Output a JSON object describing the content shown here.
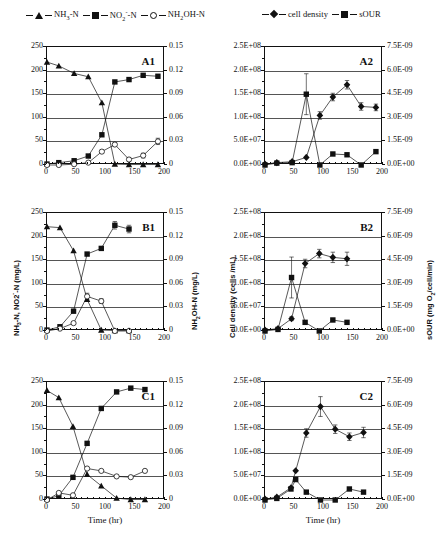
{
  "figure": {
    "legend_left": [
      {
        "label": "NH3-N",
        "marker": "triangle",
        "html": "NH<sub>3</sub>-N"
      },
      {
        "label": "NO2--N",
        "marker": "square",
        "html": "NO<sub>2</sub><sup>-</sup>-N"
      },
      {
        "label": "NH2OH-N",
        "marker": "open-circle",
        "html": "NH<sub>2</sub>OH-N"
      }
    ],
    "legend_right": [
      {
        "label": "cell density",
        "marker": "diamond",
        "html": "cell density"
      },
      {
        "label": "sOUR",
        "marker": "square",
        "html": "sOUR"
      }
    ],
    "axis_titles": {
      "left_primary": "NH3-N, NO2--N (mg/L)",
      "left_primary_html": "NH<sub>3</sub>-N, NO2<sup>-</sup>-N (mg/L)",
      "left_secondary": "NH2OH-N (mg/L)",
      "left_secondary_html": "NH<sub>2</sub>OH-N (mg/L)",
      "right_primary": "Cell density (cells /mL)",
      "right_secondary": "sOUR",
      "right_secondary_units": "(mg O2/cell/min)",
      "right_secondary_units_html": "(mg O<sub>2</sub>/cell/min)",
      "xlabel": "Time (hr)"
    },
    "ticks": {
      "x": [
        "0",
        "50",
        "100",
        "150",
        "200"
      ],
      "left_primary": [
        "0",
        "50",
        "100",
        "150",
        "200",
        "250"
      ],
      "left_secondary": [
        "0",
        "0.03",
        "0.06",
        "0.09",
        "0.12",
        "0.15"
      ],
      "right_primary": [
        "0.0E+00",
        "5.0E+07",
        "1.0E+08",
        "1.5E+08",
        "2.0E+08",
        "2.5E+08"
      ],
      "right_secondary": [
        "0.0E+00",
        "1.5E-09",
        "3.0E-09",
        "4.5E-09",
        "6.0E-09",
        "7.5E-09"
      ]
    },
    "panel_labels": [
      "A1",
      "A2",
      "B1",
      "B2",
      "C1",
      "C2"
    ]
  },
  "chart_data": [
    {
      "type": "line",
      "panel": "A1",
      "title": "A1",
      "xlabel": "Time (hr)",
      "ylabel": "NH3-N, NO2--N (mg/L)",
      "y2label": "NH2OH-N (mg/L)",
      "xlim": [
        0,
        200
      ],
      "ylim": [
        0,
        250
      ],
      "y2lim": [
        0,
        0.15
      ],
      "grid": true,
      "series": [
        {
          "name": "NH3-N",
          "axis": "left",
          "marker": "triangle",
          "x": [
            0,
            20,
            46,
            70,
            93,
            115,
            139,
            163,
            188
          ],
          "y": [
            218,
            210,
            194,
            187,
            132,
            2,
            1,
            1,
            1
          ]
        },
        {
          "name": "NO2--N",
          "axis": "left",
          "marker": "square",
          "x": [
            0,
            20,
            46,
            70,
            93,
            115,
            139,
            163,
            188
          ],
          "y": [
            2,
            5,
            9,
            19,
            64,
            176,
            181,
            190,
            188
          ]
        },
        {
          "name": "NH2OH-N",
          "axis": "right",
          "marker": "open-circle",
          "x": [
            0,
            20,
            46,
            70,
            93,
            115,
            139,
            163,
            188
          ],
          "y": [
            0.0,
            0.0,
            0.001,
            0.003,
            0.017,
            0.026,
            0.007,
            0.012,
            0.03
          ],
          "yerr": [
            0,
            0,
            0,
            0,
            0.002,
            0.002,
            0.002,
            0.003,
            0.004
          ]
        }
      ]
    },
    {
      "type": "line",
      "panel": "A2",
      "title": "A2",
      "xlabel": "Time (hr)",
      "ylabel": "Cell density (cells /mL)",
      "y2label": "sOUR (mg O2/cell/min)",
      "xlim": [
        0,
        200
      ],
      "ylim": [
        0,
        250000000
      ],
      "y2lim": [
        0,
        7.5e-09
      ],
      "grid": true,
      "series": [
        {
          "name": "cell density",
          "axis": "left",
          "marker": "diamond",
          "x": [
            0,
            20,
            46,
            70,
            93,
            115,
            139,
            163,
            188
          ],
          "y": [
            2000000,
            5000000,
            7000000,
            16000000,
            105000000,
            144000000,
            170000000,
            124000000,
            122000000
          ],
          "yerr": [
            0,
            0,
            0,
            0,
            8000000,
            8000000,
            9000000,
            8000000,
            7000000
          ]
        },
        {
          "name": "sOUR",
          "axis": "right",
          "marker": "square",
          "x": [
            0,
            20,
            46,
            70,
            93,
            115,
            139,
            163,
            188
          ],
          "y": [
            0,
            1.2e-10,
            1.5e-10,
            4.5e-09,
            0.0,
            7e-10,
            6.5e-10,
            0.0,
            8.5e-10
          ],
          "yerr": [
            0,
            0,
            0,
            1.3e-09,
            0,
            0,
            0,
            0,
            0
          ]
        }
      ]
    },
    {
      "type": "line",
      "panel": "B1",
      "title": "B1",
      "xlabel": "Time (hr)",
      "ylabel": "NH3-N, NO2--N (mg/L)",
      "y2label": "NH2OH-N (mg/L)",
      "xlim": [
        0,
        200
      ],
      "ylim": [
        0,
        250
      ],
      "y2lim": [
        0,
        0.15
      ],
      "grid": true,
      "series": [
        {
          "name": "NH3-N",
          "axis": "left",
          "marker": "triangle",
          "x": [
            0,
            22,
            45,
            68,
            92,
            115,
            139
          ],
          "y": [
            221,
            219,
            170,
            67,
            2,
            1,
            1
          ]
        },
        {
          "name": "NO2--N",
          "axis": "left",
          "marker": "square",
          "x": [
            0,
            22,
            45,
            68,
            92,
            115,
            139
          ],
          "y": [
            2,
            9,
            42,
            163,
            175,
            224,
            216
          ],
          "yerr": [
            0,
            0,
            0,
            0,
            0,
            8,
            8
          ]
        },
        {
          "name": "NH2OH-N",
          "axis": "right",
          "marker": "open-circle",
          "x": [
            0,
            22,
            45,
            68,
            92,
            115,
            139
          ],
          "y": [
            0.0,
            0.003,
            0.01,
            0.044,
            0.038,
            0.0,
            0.0
          ],
          "yerr": [
            0,
            0,
            0,
            0.004,
            0.003,
            0,
            0
          ]
        }
      ]
    },
    {
      "type": "line",
      "panel": "B2",
      "title": "B2",
      "xlabel": "Time (hr)",
      "ylabel": "Cell density (cells /mL)",
      "y2label": "sOUR (mg O2/cell/min)",
      "xlim": [
        0,
        200
      ],
      "ylim": [
        0,
        250000000
      ],
      "y2lim": [
        0,
        7.5e-09
      ],
      "grid": true,
      "series": [
        {
          "name": "cell density",
          "axis": "left",
          "marker": "diamond",
          "x": [
            0,
            22,
            45,
            68,
            92,
            115,
            139
          ],
          "y": [
            2000000,
            5000000,
            26000000,
            143000000,
            164000000,
            156000000,
            153000000
          ],
          "yerr": [
            0,
            0,
            4000000,
            9000000,
            9000000,
            11000000,
            14000000
          ]
        },
        {
          "name": "sOUR",
          "axis": "right",
          "marker": "square",
          "x": [
            0,
            22,
            45,
            68,
            92,
            115,
            139
          ],
          "y": [
            0,
            1e-10,
            3.4e-09,
            5.5e-10,
            0.0,
            7e-10,
            5.5e-10
          ],
          "yerr": [
            0,
            0,
            1.3e-09,
            0,
            0,
            0,
            0
          ]
        }
      ]
    },
    {
      "type": "line",
      "panel": "C1",
      "title": "C1",
      "xlabel": "Time (hr)",
      "ylabel": "NH3-N, NO2--N (mg/L)",
      "y2label": "NH2OH-N (mg/L)",
      "xlim": [
        0,
        200
      ],
      "ylim": [
        0,
        250
      ],
      "y2lim": [
        0,
        0.15
      ],
      "grid": true,
      "series": [
        {
          "name": "NH3-N",
          "axis": "left",
          "marker": "triangle",
          "x": [
            0,
            20,
            44,
            68,
            92,
            118,
            142,
            166
          ],
          "y": [
            232,
            217,
            156,
            54,
            30,
            4,
            1,
            1
          ]
        },
        {
          "name": "NO2--N",
          "axis": "left",
          "marker": "square",
          "x": [
            0,
            20,
            44,
            68,
            92,
            118,
            142,
            166
          ],
          "y": [
            2,
            9,
            48,
            120,
            194,
            229,
            237,
            234
          ]
        },
        {
          "name": "NH2OH-N",
          "axis": "right",
          "marker": "open-circle",
          "x": [
            0,
            20,
            44,
            68,
            92,
            118,
            142,
            166
          ],
          "y": [
            0.0,
            0.009,
            0.006,
            0.04,
            0.037,
            0.03,
            0.029,
            0.037
          ]
        }
      ]
    },
    {
      "type": "line",
      "panel": "C2",
      "title": "C2",
      "xlabel": "Time (hr)",
      "ylabel": "Cell density (cells /mL)",
      "y2label": "sOUR (mg O2/cell/min)",
      "xlim": [
        0,
        200
      ],
      "ylim": [
        0,
        250000000
      ],
      "y2lim": [
        0,
        7.5e-09
      ],
      "grid": true,
      "series": [
        {
          "name": "cell density",
          "axis": "left",
          "marker": "diamond",
          "x": [
            0,
            20,
            44,
            52,
            70,
            94,
            119,
            143,
            167
          ],
          "y": [
            2000000,
            6000000,
            26000000,
            62000000,
            142000000,
            198000000,
            150000000,
            134000000,
            143000000
          ],
          "yerr": [
            0,
            0,
            0,
            0,
            9000000,
            21000000,
            9000000,
            8000000,
            11000000
          ]
        },
        {
          "name": "sOUR",
          "axis": "right",
          "marker": "square",
          "x": [
            0,
            20,
            44,
            52,
            70,
            94,
            119,
            143,
            167
          ],
          "y": [
            0,
            1e-10,
            7e-10,
            1.3e-09,
            5e-10,
            0.0,
            0.0,
            7e-10,
            5e-10
          ]
        }
      ]
    }
  ]
}
